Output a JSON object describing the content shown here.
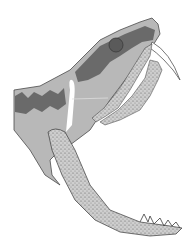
{
  "image": {
    "subject": "saber-toothed cat skull illustration",
    "style": "grayscale anatomical drawing",
    "colors": {
      "background": "#ffffff",
      "skull_light": "#b8b8b8",
      "skull_dark": "#6a6a6a",
      "bone_stipple": "#c4c4c4",
      "outline": "#4a4a4a"
    }
  }
}
